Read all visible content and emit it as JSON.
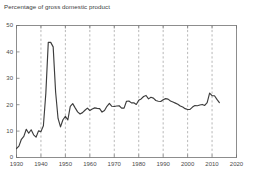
{
  "chart_data": {
    "type": "line",
    "title": "Percentage of gross domestic product",
    "xlabel": "",
    "ylabel": "",
    "xlim": [
      1930,
      2020
    ],
    "ylim": [
      0,
      50
    ],
    "xticks": [
      "1930",
      "1940",
      "1950",
      "1960",
      "1970",
      "1980",
      "1990",
      "2000",
      "2010",
      "2020"
    ],
    "yticks": [
      "0",
      "10",
      "20",
      "30",
      "40",
      "50"
    ],
    "grid": "vertical-dashed",
    "legend": "none",
    "line_color": "#3d3d3d",
    "series": [
      {
        "name": "Percentage of gross domestic product",
        "x": [
          1930,
          1931,
          1932,
          1933,
          1934,
          1935,
          1936,
          1937,
          1938,
          1939,
          1940,
          1941,
          1942,
          1943,
          1944,
          1945,
          1946,
          1947,
          1948,
          1949,
          1950,
          1951,
          1952,
          1953,
          1954,
          1955,
          1956,
          1957,
          1958,
          1959,
          1960,
          1961,
          1962,
          1963,
          1964,
          1965,
          1966,
          1967,
          1968,
          1969,
          1970,
          1971,
          1972,
          1973,
          1974,
          1975,
          1976,
          1977,
          1978,
          1979,
          1980,
          1981,
          1982,
          1983,
          1984,
          1985,
          1986,
          1987,
          1988,
          1989,
          1990,
          1991,
          1992,
          1993,
          1994,
          1995,
          1996,
          1997,
          1998,
          1999,
          2000,
          2001,
          2002,
          2003,
          2004,
          2005,
          2006,
          2007,
          2008,
          2009,
          2010,
          2011,
          2012,
          2013
        ],
        "values": [
          3.4,
          4.3,
          6.9,
          8.0,
          10.7,
          9.2,
          10.5,
          8.6,
          7.7,
          10.1,
          9.8,
          12.0,
          24.3,
          43.6,
          43.6,
          41.9,
          24.8,
          14.8,
          11.6,
          14.3,
          15.6,
          14.2,
          19.4,
          20.4,
          18.8,
          17.3,
          16.5,
          17.0,
          17.9,
          18.7,
          17.8,
          18.4,
          18.8,
          18.6,
          18.5,
          17.2,
          17.8,
          19.4,
          20.5,
          19.4,
          19.3,
          19.5,
          19.6,
          18.7,
          18.7,
          21.3,
          21.4,
          20.7,
          20.7,
          20.1,
          21.7,
          22.2,
          23.1,
          23.5,
          22.2,
          22.8,
          22.5,
          21.6,
          21.3,
          21.2,
          21.9,
          22.3,
          22.1,
          21.4,
          21.0,
          20.6,
          20.2,
          19.5,
          19.1,
          18.5,
          18.2,
          18.2,
          19.1,
          19.7,
          19.6,
          19.9,
          20.1,
          19.7,
          20.8,
          24.4,
          23.4,
          23.4,
          22.0,
          20.8
        ]
      }
    ]
  }
}
